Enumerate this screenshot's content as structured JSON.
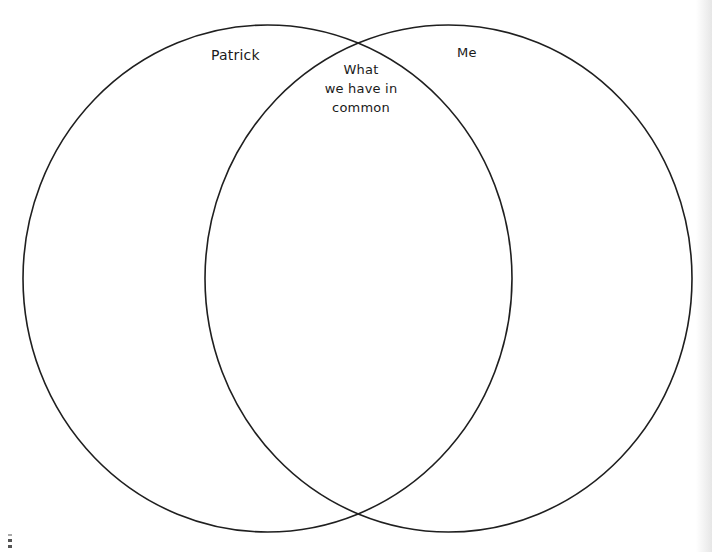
{
  "diagram": {
    "type": "venn",
    "sets": [
      {
        "id": "left",
        "label": "Patrick"
      },
      {
        "id": "right",
        "label": "Me"
      }
    ],
    "intersection": {
      "label_lines": [
        "What",
        "we have in",
        "common"
      ]
    },
    "colors": {
      "stroke": "#1f1f1f",
      "background": "#ffffff",
      "text": "#1a1a1a"
    }
  }
}
